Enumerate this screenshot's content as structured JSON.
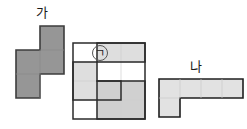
{
  "figure": {
    "title": "",
    "canvas": {
      "width": 247,
      "height": 129,
      "background": "#ffffff"
    },
    "colors": {
      "piece_ga_fill": "#969696",
      "piece_ga_stroke": "#3c3c3c",
      "piece_na_fill": "#e0e0e0",
      "piece_na_stroke": "#1f1f1f",
      "grid_outline_stroke": "#2b2b2b",
      "grid_faint_line": "#cfcfcf",
      "cell_light_fill": "#e2e2e2",
      "cell_mid_fill": "#d2d2d2",
      "cell_empty_fill": "#ffffff",
      "label_text": "#1a1a1a"
    },
    "labels": {
      "ga": "가",
      "na": "나",
      "circled_marker": "㉠"
    },
    "shapes": [
      {
        "name": "piece-ga",
        "label": "가",
        "description": "S-shaped tetromino, dark gray fill",
        "cell_size": 24,
        "origin": {
          "x": 16,
          "y": 26
        },
        "cells": [
          {
            "col": 1,
            "row": 0
          },
          {
            "col": 1,
            "row": 1
          },
          {
            "col": 0,
            "row": 1
          },
          {
            "col": 0,
            "row": 2
          }
        ],
        "outline_points": "40,26 64,26 64,74 40,74 40,98 16,98 16,50 40,50"
      },
      {
        "name": "grid-middle",
        "description": "3 column by 4 row grid containing three highlighted blocks and the circled marker",
        "origin": {
          "x": 73,
          "y": 43
        },
        "cell_width": 24,
        "cell_height": 19,
        "columns": 3,
        "rows": 4,
        "blocks": [
          {
            "name": "block-top-right",
            "shade": "light",
            "cells": [
              {
                "col": 1,
                "row": 0
              },
              {
                "col": 2,
                "row": 0
              }
            ]
          },
          {
            "name": "block-left-vertical",
            "shade": "light",
            "cells": [
              {
                "col": 0,
                "row": 1
              },
              {
                "col": 0,
                "row": 2
              },
              {
                "col": 1,
                "row": 2
              }
            ]
          },
          {
            "name": "block-bottom-right",
            "shade": "mid",
            "cells": [
              {
                "col": 1,
                "row": 2
              },
              {
                "col": 2,
                "row": 2
              },
              {
                "col": 1,
                "row": 3
              },
              {
                "col": 2,
                "row": 3
              }
            ]
          }
        ],
        "marker": {
          "text": "㉠",
          "col": 1,
          "row": 0,
          "x": 100,
          "y": 53
        }
      },
      {
        "name": "piece-na",
        "label": "나",
        "description": "L-shaped piece, four cells wide on top with one cell descending at the left",
        "origin": {
          "x": 159,
          "y": 79
        },
        "cell_width": 21,
        "cell_height": 19,
        "cells": [
          {
            "col": 0,
            "row": 0
          },
          {
            "col": 1,
            "row": 0
          },
          {
            "col": 2,
            "row": 0
          },
          {
            "col": 3,
            "row": 0
          },
          {
            "col": 0,
            "row": 1
          }
        ],
        "outline_points": "159,79 243,79 243,98 180,98 180,117 159,117"
      }
    ]
  }
}
